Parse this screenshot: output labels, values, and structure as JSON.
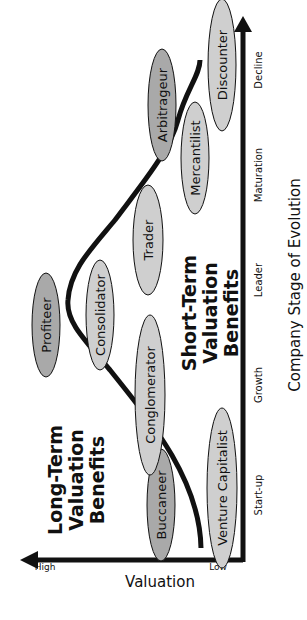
{
  "diagram": {
    "y_axis": {
      "label": "Valuation",
      "high": "High",
      "low": "Low"
    },
    "x_axis": {
      "label": "Company Stage of Evolution",
      "stages": [
        "Start-up",
        "Growth",
        "Leader",
        "Maturation",
        "Decline"
      ]
    },
    "regions": {
      "long_term": [
        "Long-Term",
        "Valuation",
        "Benefits"
      ],
      "short_term": [
        "Short-Term",
        "Valuation",
        "Benefits"
      ]
    },
    "roles": [
      {
        "label": "Buccaneer",
        "shade": "dark"
      },
      {
        "label": "Venture Capitalist",
        "shade": "light"
      },
      {
        "label": "Conglomerator",
        "shade": "light"
      },
      {
        "label": "Profiteer",
        "shade": "dark"
      },
      {
        "label": "Consolidator",
        "shade": "light"
      },
      {
        "label": "Trader",
        "shade": "light"
      },
      {
        "label": "Mercantilist",
        "shade": "light"
      },
      {
        "label": "Arbitrageur",
        "shade": "dark"
      },
      {
        "label": "Discounter",
        "shade": "light"
      }
    ],
    "colors": {
      "dark_fill": "#a9a9a9",
      "light_fill": "#cfcfcf",
      "stroke": "#111111"
    }
  }
}
